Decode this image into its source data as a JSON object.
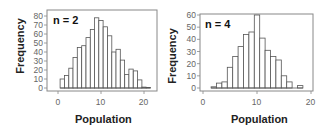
{
  "chart_data": [
    {
      "type": "bar",
      "title": "n = 2",
      "xlabel": "Population",
      "ylabel": "Frequency",
      "xlim": [
        -2.5,
        23
      ],
      "ylim": [
        0,
        82
      ],
      "xticks": [
        0,
        10,
        20
      ],
      "yticks": [
        0,
        10,
        20,
        30,
        40,
        50,
        60,
        70,
        80
      ],
      "grid": false,
      "legend": "none",
      "bin_width": 1,
      "categories": [
        1,
        2,
        3,
        4,
        5,
        6,
        7,
        8,
        9,
        10,
        11,
        12,
        13,
        14,
        15,
        16,
        17,
        18,
        19,
        20,
        21
      ],
      "values": [
        10,
        14,
        22,
        34,
        45,
        47,
        56,
        65,
        78,
        75,
        68,
        58,
        40,
        43,
        31,
        15,
        21,
        19,
        9,
        1,
        0.5
      ]
    },
    {
      "type": "bar",
      "title": "n = 4",
      "xlabel": "Population",
      "ylabel": "Frequency",
      "xlim": [
        0,
        20
      ],
      "ylim": [
        0,
        61
      ],
      "xticks": [
        0,
        10,
        20
      ],
      "yticks": [
        0,
        10,
        20,
        30,
        40,
        50,
        60
      ],
      "grid": false,
      "legend": "none",
      "bin_width": 1,
      "categories": [
        2,
        3,
        4,
        5,
        6,
        7,
        8,
        9,
        10,
        11,
        12,
        13,
        14,
        15,
        16,
        17,
        18
      ],
      "values": [
        1,
        4,
        5,
        17,
        26,
        34,
        44,
        46,
        60,
        41,
        31,
        26,
        23,
        10,
        5,
        0,
        2
      ]
    }
  ],
  "panels": [
    {
      "n_label": "n = 2",
      "ylabel": "Frequency",
      "xlabel": "Population",
      "yticks": [
        "80",
        "70",
        "60",
        "50",
        "40",
        "30",
        "20",
        "10",
        "0"
      ],
      "xticks": [
        "0",
        "10",
        "20"
      ]
    },
    {
      "n_label": "n = 4",
      "ylabel": "Frequency",
      "xlabel": "Population",
      "yticks": [
        "60",
        "50",
        "40",
        "30",
        "20",
        "10",
        "0"
      ],
      "xticks": [
        "0",
        "10",
        "20"
      ]
    }
  ],
  "colors": {
    "bar_fill": "#ffffff",
    "bar_stroke": "#555555",
    "frame": "#888888",
    "tick_text": "#666666"
  }
}
